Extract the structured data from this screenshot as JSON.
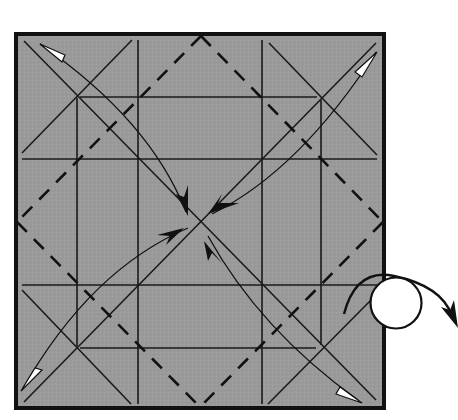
{
  "diagram": {
    "paper": {
      "fill": "#9a9a9a",
      "border_color": "#111111",
      "x": 14,
      "y": 32,
      "width": 372,
      "height": 378
    },
    "center": {
      "x": 200,
      "y": 222
    },
    "valley_fold_lines": [
      {
        "name": "vertical-1",
        "x1": 77,
        "y1": 38,
        "x2": 77,
        "y2": 404
      },
      {
        "name": "vertical-2",
        "x1": 138,
        "y1": 38,
        "x2": 138,
        "y2": 404
      },
      {
        "name": "vertical-3",
        "x1": 262,
        "y1": 38,
        "x2": 262,
        "y2": 404
      },
      {
        "name": "vertical-4",
        "x1": 322,
        "y1": 38,
        "x2": 322,
        "y2": 404
      },
      {
        "name": "horizontal-1",
        "x1": 20,
        "y1": 97,
        "x2": 380,
        "y2": 97
      },
      {
        "name": "horizontal-2",
        "x1": 20,
        "y1": 158,
        "x2": 380,
        "y2": 158
      },
      {
        "name": "horizontal-3",
        "x1": 20,
        "y1": 285,
        "x2": 380,
        "y2": 285
      },
      {
        "name": "horizontal-4",
        "x1": 20,
        "y1": 347,
        "x2": 380,
        "y2": 347
      },
      {
        "name": "diagonal-main-1",
        "x1": 22,
        "y1": 40,
        "x2": 378,
        "y2": 402
      },
      {
        "name": "diagonal-main-2",
        "x1": 378,
        "y1": 42,
        "x2": 22,
        "y2": 402
      },
      {
        "name": "corner-tl-x",
        "x1": 22,
        "y1": 153,
        "x2": 132,
        "y2": 40
      },
      {
        "name": "corner-tr-x",
        "x1": 268,
        "y1": 42,
        "x2": 378,
        "y2": 155
      },
      {
        "name": "corner-bl-x",
        "x1": 22,
        "y1": 290,
        "x2": 132,
        "y2": 404
      },
      {
        "name": "corner-br-x",
        "x1": 268,
        "y1": 404,
        "x2": 378,
        "y2": 290
      }
    ],
    "mountain_fold_diamond": {
      "top": {
        "x": 201,
        "y": 35
      },
      "right": {
        "x": 384,
        "y": 222
      },
      "bottom": {
        "x": 200,
        "y": 408
      },
      "left": {
        "x": 16,
        "y": 222
      }
    },
    "arrows": [
      {
        "name": "arrow-top-left-corner-to-center",
        "from": {
          "x": 36,
          "y": 40
        },
        "to": {
          "x": 186,
          "y": 212
        },
        "tail_head": "white-open",
        "tip_head": "black"
      },
      {
        "name": "arrow-top-right-corner-to-center",
        "from": {
          "x": 378,
          "y": 55
        },
        "to": {
          "x": 210,
          "y": 214
        },
        "tail_head": "white-open",
        "tip_head": "black"
      },
      {
        "name": "arrow-bottom-left-corner-to-center",
        "from": {
          "x": 20,
          "y": 392
        },
        "to": {
          "x": 188,
          "y": 228
        },
        "tail_head": "white-open",
        "tip_head": "black"
      },
      {
        "name": "arrow-bottom-right-corner-to-center",
        "from": {
          "x": 362,
          "y": 404
        },
        "to": {
          "x": 206,
          "y": 236
        },
        "tail_head": "white-open",
        "tip_head": "black"
      }
    ],
    "turn_over_symbol": {
      "circle": {
        "cx": 396,
        "cy": 303,
        "r": 26
      },
      "arrow_label": "turn over"
    }
  }
}
